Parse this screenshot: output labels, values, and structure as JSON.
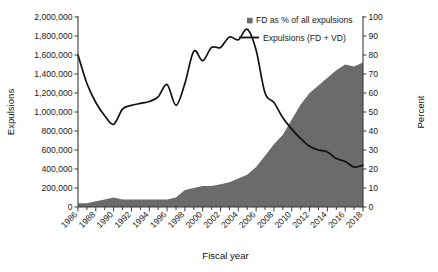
{
  "chart_data": {
    "type": "area",
    "title": "",
    "xlabel": "Fiscal year",
    "ylabel": "Expulsions",
    "ylabel_right": "Percent",
    "grid": false,
    "legend_position": "top-right",
    "x": [
      1986,
      1987,
      1988,
      1989,
      1990,
      1991,
      1992,
      1993,
      1994,
      1995,
      1996,
      1997,
      1998,
      1999,
      2000,
      2001,
      2002,
      2003,
      2004,
      2005,
      2006,
      2007,
      2008,
      2009,
      2010,
      2011,
      2012,
      2013,
      2014,
      2015,
      2016,
      2017,
      2018
    ],
    "xlim": [
      1986,
      2018
    ],
    "ylim": [
      0,
      2000000
    ],
    "ylim_right": [
      0,
      100
    ],
    "yticks": [
      0,
      200000,
      400000,
      600000,
      800000,
      1000000,
      1200000,
      1400000,
      1600000,
      1800000,
      2000000
    ],
    "ytick_labels": [
      "0",
      "200,000",
      "400,000",
      "600,000",
      "800,000",
      "1,000,000",
      "1,200,000",
      "1,400,000",
      "1,600,000",
      "1,800,000",
      "2,000,000"
    ],
    "yticks_right": [
      0,
      10,
      20,
      30,
      40,
      50,
      60,
      70,
      80,
      90,
      100
    ],
    "ytick_labels_right": [
      "0",
      "10",
      "20",
      "30",
      "40",
      "50",
      "60",
      "70",
      "80",
      "90",
      "100"
    ],
    "xtick_labels": [
      "1986",
      "1988",
      "1990",
      "1992",
      "1994",
      "1996",
      "1998",
      "2000",
      "2002",
      "2004",
      "2006",
      "2008",
      "2010",
      "2012",
      "2014",
      "2016",
      "2018"
    ],
    "xticks_major": [
      1986,
      1988,
      1990,
      1992,
      1994,
      1996,
      1998,
      2000,
      2002,
      2004,
      2006,
      2008,
      2010,
      2012,
      2014,
      2016,
      2018
    ],
    "series": [
      {
        "name": "FD as % of all expulsions",
        "kind": "area",
        "axis": "right",
        "color": "#6b6b6b",
        "values": [
          2,
          2,
          3,
          4,
          5,
          4,
          4,
          4,
          4,
          4,
          4,
          5,
          9,
          10,
          11,
          11,
          12,
          13,
          15,
          17,
          21,
          27,
          33,
          38,
          46,
          54,
          60,
          64,
          68,
          72,
          75,
          74,
          76
        ]
      },
      {
        "name": "Expulsions (FD + VD)",
        "kind": "line",
        "axis": "left",
        "color": "#111111",
        "values": [
          1600000,
          1300000,
          1100000,
          960000,
          870000,
          1030000,
          1070000,
          1090000,
          1110000,
          1160000,
          1290000,
          1070000,
          1300000,
          1640000,
          1540000,
          1680000,
          1680000,
          1790000,
          1760000,
          1870000,
          1650000,
          1200000,
          1100000,
          940000,
          820000,
          720000,
          640000,
          600000,
          580000,
          510000,
          480000,
          420000,
          440000
        ]
      }
    ],
    "legend": [
      {
        "label": "FD as % of all expulsions",
        "marker": "square",
        "color": "#6b6b6b"
      },
      {
        "label": "Expulsions (FD + VD)",
        "marker": "line",
        "color": "#111111"
      }
    ]
  }
}
